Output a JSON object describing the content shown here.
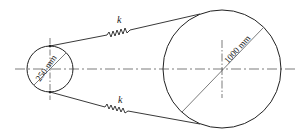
{
  "diagram": {
    "small_pulley": {
      "diameter_label": "250 mm"
    },
    "large_pulley": {
      "diameter_label": "1000 mm"
    },
    "springs": [
      {
        "position": "top",
        "label": "k"
      },
      {
        "position": "bottom",
        "label": "k"
      }
    ],
    "line_color": "#222222"
  }
}
